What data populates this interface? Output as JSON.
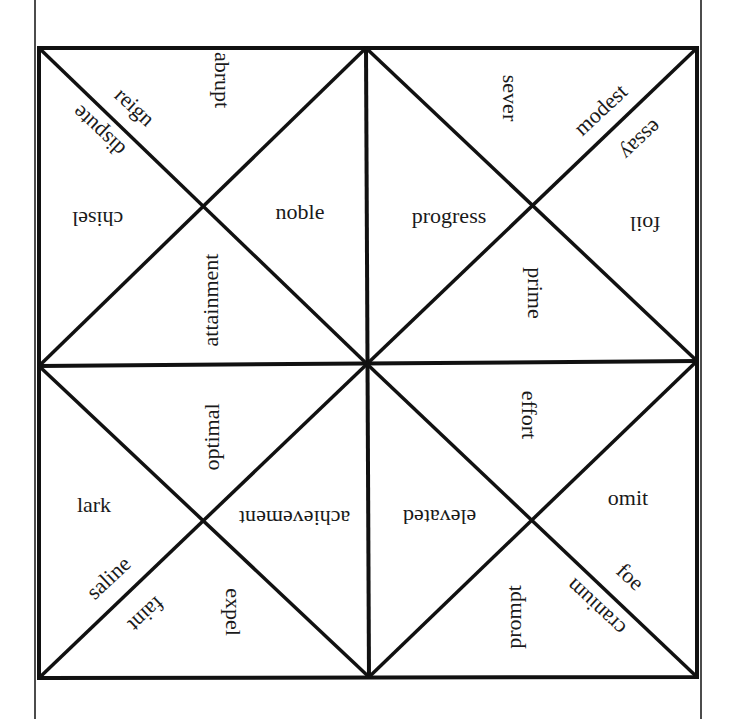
{
  "worksheet": {
    "type": "Vocabulary fortune-teller / tarsia puzzle square",
    "colors": {
      "background": "#ffffff",
      "line": "#111111",
      "text": "#1a1a1a"
    },
    "frame": {
      "outer_left_x": 35,
      "outer_right_x": 701,
      "square": {
        "x1": 39,
        "y1": 48,
        "x2": 697,
        "y2": 677
      },
      "center": {
        "x": 367,
        "y": 364
      },
      "quadrant_centers": {
        "top_left": {
          "x": 204,
          "y": 207
        },
        "top_right": {
          "x": 533,
          "y": 205
        },
        "bottom_left": {
          "x": 203,
          "y": 518
        },
        "bottom_right": {
          "x": 532,
          "y": 516
        }
      }
    },
    "quadrants": {
      "top_left": {
        "words": [
          {
            "text": "abrupt",
            "x": 222,
            "y": 80,
            "rotate": 90
          },
          {
            "text": "reign",
            "x": 135,
            "y": 107,
            "rotate": 43
          },
          {
            "text": "dispute",
            "x": 99,
            "y": 131,
            "rotate": 223
          },
          {
            "text": "chisel",
            "x": 98,
            "y": 219,
            "rotate": 180
          },
          {
            "text": "noble",
            "x": 300,
            "y": 212,
            "rotate": 0
          },
          {
            "text": "attainment",
            "x": 211,
            "y": 300,
            "rotate": -90
          }
        ]
      },
      "top_right": {
        "words": [
          {
            "text": "sever",
            "x": 510,
            "y": 98,
            "rotate": 90
          },
          {
            "text": "modest",
            "x": 601,
            "y": 110,
            "rotate": -43
          },
          {
            "text": "essay",
            "x": 641,
            "y": 140,
            "rotate": 137
          },
          {
            "text": "progress",
            "x": 449,
            "y": 216,
            "rotate": 0
          },
          {
            "text": "foil",
            "x": 645,
            "y": 224,
            "rotate": 180
          },
          {
            "text": "prime",
            "x": 535,
            "y": 293,
            "rotate": 90
          }
        ]
      },
      "bottom_left": {
        "words": [
          {
            "text": "optimal",
            "x": 212,
            "y": 437,
            "rotate": -90
          },
          {
            "text": "lark",
            "x": 94,
            "y": 505,
            "rotate": 0
          },
          {
            "text": "achievement",
            "x": 295,
            "y": 518,
            "rotate": 180
          },
          {
            "text": "saline",
            "x": 109,
            "y": 578,
            "rotate": -43
          },
          {
            "text": "faint",
            "x": 146,
            "y": 614,
            "rotate": 137
          },
          {
            "text": "expel",
            "x": 233,
            "y": 612,
            "rotate": 90
          }
        ]
      },
      "bottom_right": {
        "words": [
          {
            "text": "effort",
            "x": 529,
            "y": 415,
            "rotate": 90
          },
          {
            "text": "omit",
            "x": 628,
            "y": 498,
            "rotate": 0
          },
          {
            "text": "elevated",
            "x": 440,
            "y": 517,
            "rotate": 180
          },
          {
            "text": "foe",
            "x": 630,
            "y": 577,
            "rotate": 43
          },
          {
            "text": "cranium",
            "x": 596,
            "y": 607,
            "rotate": 223
          },
          {
            "text": "prompt",
            "x": 514,
            "y": 617,
            "rotate": -90
          }
        ]
      }
    }
  }
}
